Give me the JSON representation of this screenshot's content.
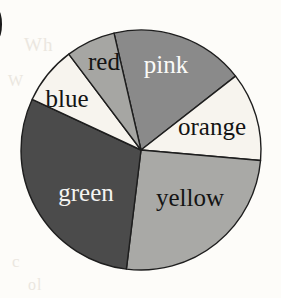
{
  "page": {
    "background_color": "#fdfcf9",
    "corner_glyph": ")",
    "bleed_text": {
      "line1": "Wh",
      "line2": "W",
      "line3": "c",
      "line4": "ol"
    }
  },
  "chart_data": {
    "type": "pie",
    "title": "",
    "subtitle": "",
    "xlabel": "",
    "ylabel": "",
    "legend_position": "none",
    "labels_inside": true,
    "center": {
      "x": 141,
      "y": 150
    },
    "radius": 120,
    "start_angle_deg": 347,
    "direction": "clockwise",
    "outline_color": "#1e1e1e",
    "categories": [
      "pink",
      "orange",
      "yellow",
      "green",
      "blue",
      "red"
    ],
    "values": [
      18,
      12,
      25.5,
      30,
      7.5,
      7
    ],
    "slices": [
      {
        "label": "pink",
        "value": 18,
        "start_deg": 347,
        "end_deg": 412,
        "sweep_deg": 65,
        "fill": "#8a8a8a",
        "text_color": "#fbfbf8",
        "label_x": 166,
        "label_y": 67,
        "font_size": 26
      },
      {
        "label": "orange",
        "value": 12,
        "start_deg": 52,
        "end_deg": 95,
        "sweep_deg": 43,
        "fill": "#f7f4ee",
        "text_color": "#141414",
        "label_x": 212,
        "label_y": 129,
        "font_size": 25
      },
      {
        "label": "yellow",
        "value": 25.5,
        "start_deg": 95,
        "end_deg": 187,
        "sweep_deg": 92,
        "fill": "#a9a9a6",
        "text_color": "#141414",
        "label_x": 190,
        "label_y": 200,
        "font_size": 26
      },
      {
        "label": "green",
        "value": 30,
        "start_deg": 187,
        "end_deg": 295,
        "sweep_deg": 108,
        "fill": "#4b4b4b",
        "text_color": "#f4f4f1",
        "label_x": 86,
        "label_y": 195,
        "font_size": 26
      },
      {
        "label": "blue",
        "value": 7.5,
        "start_deg": 295,
        "end_deg": 323,
        "sweep_deg": 28,
        "fill": "#f7f4ee",
        "text_color": "#141414",
        "label_x": 67,
        "label_y": 101,
        "font_size": 26
      },
      {
        "label": "red",
        "value": 7,
        "start_deg": 323,
        "end_deg": 347,
        "sweep_deg": 24,
        "fill": "#a6a6a3",
        "text_color": "#141414",
        "label_x": 104,
        "label_y": 64,
        "font_size": 25
      }
    ]
  }
}
